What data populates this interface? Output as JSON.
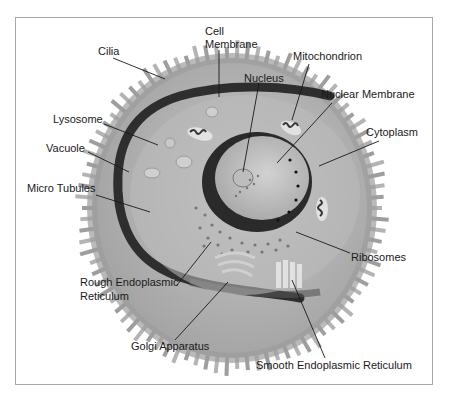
{
  "diagram": {
    "colors": {
      "cilia": "#9a9a9a",
      "cytoplasm_outer": "#a9a9a9",
      "cytoplasm_inner": "#bdbdbd",
      "membrane_band": "#2e2e2e",
      "nucleus": "#c4c4c4",
      "nuclear_rim": "#262626",
      "leader_line": "#1a1a1a",
      "frame": "#a8a8a8"
    },
    "labels": {
      "cilia": "Cilia",
      "cell_membrane_1": "Cell",
      "cell_membrane_2": "Membrane",
      "mitochondrion": "Mitochondrion",
      "nucleus": "Nucleus",
      "nuclear_membrane": "Nuclear Membrane",
      "lysosome": "Lysosome",
      "vacuole": "Vacuole",
      "cytoplasm": "Cytoplasm",
      "micro_tubules": "Micro Tubules",
      "ribosomes": "Ribosomes",
      "rough_er_1": "Rough Endoplasmic",
      "rough_er_2": "Reticulum",
      "golgi": "Golgi Apparatus",
      "smooth_er": "Smooth Endoplasmic Reticulum"
    }
  }
}
